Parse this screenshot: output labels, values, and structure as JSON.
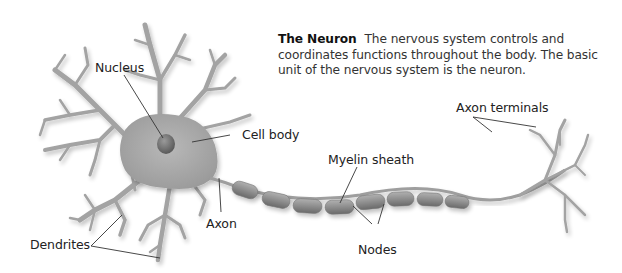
{
  "caption": {
    "title": "The Neuron",
    "text": "The nervous system controls and coordinates functions throughout the body. The basic unit of the nervous system is the neuron."
  },
  "labels": {
    "nucleus": "Nucleus",
    "cell_body": "Cell body",
    "myelin_sheath": "Myelin sheath",
    "axon_terminals": "Axon terminals",
    "axon": "Axon",
    "dendrites": "Dendrites",
    "nodes": "Nodes"
  },
  "colors": {
    "cell_fill": "#a9a9a9",
    "nucleus_fill": "#6e6e6e",
    "myelin_fill": "#8f8f8f",
    "leader_line": "#333333",
    "background": "#ffffff"
  }
}
